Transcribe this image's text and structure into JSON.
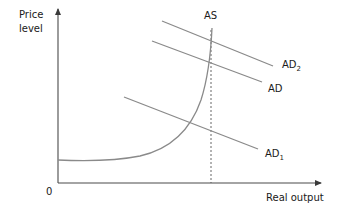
{
  "diagram": {
    "type": "economics-ad-as",
    "y_axis_label_line1": "Price",
    "y_axis_label_line2": "level",
    "x_axis_label": "Real output",
    "origin_label": "0",
    "curves": {
      "as": {
        "label": "AS"
      },
      "ad": {
        "label": "AD"
      },
      "ad2": {
        "label": "AD",
        "subscript": "2"
      },
      "ad1": {
        "label": "AD",
        "subscript": "1"
      }
    },
    "dashed_line": "full-capacity output",
    "colors": {
      "axis": "#4a4a4a",
      "curve": "#8a8a8a",
      "text": "#1a1a1a"
    }
  }
}
